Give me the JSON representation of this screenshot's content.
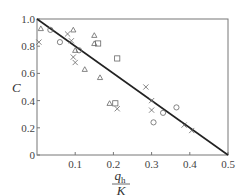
{
  "chart_data": {
    "type": "scatter",
    "title": "",
    "xlabel": "q_h / K",
    "xlabel_numerator": "q",
    "xlabel_numerator_sub": "h",
    "xlabel_denominator": "K",
    "ylabel": "C",
    "xlim": [
      0,
      0.5
    ],
    "ylim": [
      0,
      1.0
    ],
    "x_ticks": [
      0.1,
      0.2,
      0.3,
      0.4,
      0.5
    ],
    "x_tick_labels": [
      "0.1",
      "0.2",
      "0.3",
      "0.4",
      "0.5"
    ],
    "y_ticks": [
      0,
      0.2,
      0.4,
      0.6,
      0.8,
      1.0
    ],
    "y_tick_labels": [
      "0",
      "0.2",
      "0.4",
      "0.6",
      "0.8",
      "1.0"
    ],
    "grid": false,
    "legend": null,
    "frame": "box",
    "series": [
      {
        "name": "triangle",
        "marker": "triangle",
        "points": [
          [
            0.01,
            0.93
          ],
          [
            0.095,
            0.92
          ],
          [
            0.15,
            0.88
          ],
          [
            0.15,
            0.82
          ],
          [
            0.1,
            0.77
          ],
          [
            0.125,
            0.63
          ],
          [
            0.165,
            0.57
          ],
          [
            0.19,
            0.38
          ]
        ]
      },
      {
        "name": "circle",
        "marker": "circle",
        "points": [
          [
            0.035,
            0.92
          ],
          [
            0.06,
            0.83
          ],
          [
            0.11,
            0.77
          ],
          [
            0.33,
            0.31
          ],
          [
            0.365,
            0.35
          ],
          [
            0.305,
            0.24
          ]
        ]
      },
      {
        "name": "square",
        "marker": "square",
        "points": [
          [
            0.16,
            0.82
          ],
          [
            0.21,
            0.71
          ],
          [
            0.205,
            0.38
          ]
        ]
      },
      {
        "name": "cross",
        "marker": "x",
        "points": [
          [
            0.005,
            0.83
          ],
          [
            0.08,
            0.89
          ],
          [
            0.09,
            0.84
          ],
          [
            0.095,
            0.72
          ],
          [
            0.1,
            0.68
          ],
          [
            0.21,
            0.34
          ],
          [
            0.285,
            0.5
          ],
          [
            0.3,
            0.4
          ],
          [
            0.3,
            0.33
          ],
          [
            0.385,
            0.22
          ],
          [
            0.405,
            0.18
          ]
        ]
      }
    ],
    "lines": [
      {
        "name": "fit-line",
        "x": [
          0,
          0.5
        ],
        "y": [
          1.0,
          0
        ]
      }
    ]
  }
}
